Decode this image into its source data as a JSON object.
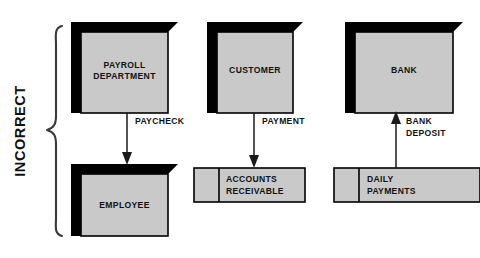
{
  "diagram": {
    "title": "INCORRECT",
    "group_label": "INCORRECT",
    "colors": {
      "box_fill": "#c9c9c9",
      "box_shadow": "#000000",
      "outline": "#000000",
      "background": "#ffffff",
      "brace": "#3a3a3a",
      "text": "#111111"
    },
    "entities": [
      {
        "id": "payroll-department",
        "label_line1": "PAYROLL",
        "label_line2": "DEPARTMENT"
      },
      {
        "id": "customer",
        "label_line1": "CUSTOMER",
        "label_line2": ""
      },
      {
        "id": "bank",
        "label_line1": "BANK",
        "label_line2": ""
      },
      {
        "id": "employee",
        "label_line1": "EMPLOYEE",
        "label_line2": ""
      }
    ],
    "data_stores": [
      {
        "id": "accounts-receivable",
        "label_line1": "ACCOUNTS",
        "label_line2": "RECEIVABLE"
      },
      {
        "id": "daily-payments",
        "label_line1": "DAILY",
        "label_line2": "PAYMENTS"
      }
    ],
    "flows": [
      {
        "id": "paycheck",
        "label_line1": "PAYCHECK",
        "label_line2": "",
        "from": "payroll-department",
        "to": "employee",
        "direction": "down"
      },
      {
        "id": "payment",
        "label_line1": "PAYMENT",
        "label_line2": "",
        "from": "customer",
        "to": "accounts-receivable",
        "direction": "down"
      },
      {
        "id": "bank-deposit",
        "label_line1": "BANK",
        "label_line2": "DEPOSIT",
        "from": "daily-payments",
        "to": "bank",
        "direction": "up"
      }
    ]
  }
}
